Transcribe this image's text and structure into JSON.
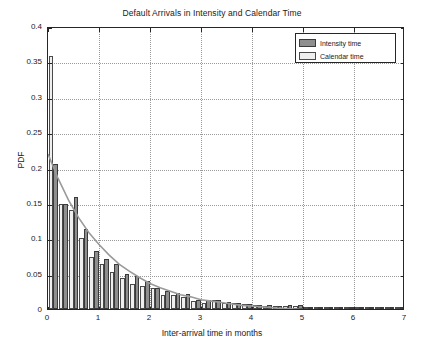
{
  "chart_data": {
    "type": "bar",
    "title": "Default Arrivals in Intensity and Calendar Time",
    "xlabel": "Inter-arrival time in months",
    "ylabel": "PDF",
    "xlim": [
      0,
      7
    ],
    "ylim": [
      0,
      0.4
    ],
    "xticks": [
      0,
      1,
      2,
      3,
      4,
      5,
      6,
      7
    ],
    "xticklabels": [
      "0",
      "1",
      "2",
      "3",
      "4",
      "5",
      "6",
      "7"
    ],
    "yticks": [
      0,
      0.05,
      0.1,
      0.15,
      0.2,
      0.25,
      0.3,
      0.35,
      0.4
    ],
    "yticklabels": [
      "0",
      "0.05",
      "0.1",
      "0.15",
      "0.2",
      "0.25",
      "0.3",
      "0.35",
      "0.4"
    ],
    "grid": true,
    "legend": {
      "position": "top-right",
      "entries": [
        {
          "label": "Intensity time",
          "color": "#8e8e8e",
          "key": "intensity"
        },
        {
          "label": "Calendar time",
          "color": "#efefef",
          "key": "calendar"
        }
      ]
    },
    "bin_width": 0.2,
    "bin_centers": [
      0.1,
      0.3,
      0.5,
      0.7,
      0.9,
      1.1,
      1.3,
      1.5,
      1.7,
      1.9,
      2.1,
      2.3,
      2.5,
      2.7,
      2.9,
      3.1,
      3.3,
      3.5,
      3.7,
      3.9,
      4.1,
      4.3,
      4.5,
      4.7,
      4.9,
      5.1,
      5.3,
      5.5,
      5.7,
      5.9,
      6.1,
      6.3,
      6.5,
      6.7,
      6.9
    ],
    "series": [
      {
        "name": "Intensity time",
        "key": "intensity",
        "values": [
          0.205,
          0.149,
          0.158,
          0.113,
          0.082,
          0.07,
          0.063,
          0.049,
          0.047,
          0.04,
          0.03,
          0.026,
          0.023,
          0.021,
          0.013,
          0.013,
          0.013,
          0.01,
          0.008,
          0.007,
          0.006,
          0.005,
          0.004,
          0.005,
          0.005,
          0.003,
          0.003,
          0.003,
          0.002,
          0.002,
          0.002,
          0.002,
          0.002,
          0.002,
          0.002
        ]
      },
      {
        "name": "Calendar time",
        "key": "calendar",
        "values": [
          0.357,
          0.148,
          0.14,
          0.1,
          0.073,
          0.063,
          0.052,
          0.044,
          0.035,
          0.033,
          0.029,
          0.02,
          0.02,
          0.017,
          0.011,
          0.009,
          0.013,
          0.009,
          0.009,
          0.007,
          0.005,
          0.004,
          0.004,
          0.004,
          0.004,
          0.003,
          0.003,
          0.002,
          0.002,
          0.002,
          0.002,
          0.002,
          0.002,
          0.002,
          0.002
        ]
      }
    ],
    "fit_curve": {
      "name": "exponential fit",
      "color": "#9a9a9a",
      "x": [
        0.0,
        0.2,
        0.4,
        0.6,
        0.8,
        1.0,
        1.2,
        1.4,
        1.6,
        1.8,
        2.0,
        2.2,
        2.4,
        2.6,
        2.8,
        3.0,
        3.2,
        3.4,
        3.6,
        3.8,
        4.0,
        4.5,
        5.0,
        5.5,
        6.0,
        6.5,
        7.0
      ],
      "y": [
        0.222,
        0.187,
        0.157,
        0.132,
        0.111,
        0.094,
        0.079,
        0.066,
        0.056,
        0.047,
        0.039,
        0.033,
        0.028,
        0.023,
        0.02,
        0.016,
        0.014,
        0.012,
        0.01,
        0.008,
        0.007,
        0.004,
        0.002,
        0.0013,
        0.0008,
        0.0005,
        0.0003
      ]
    }
  }
}
